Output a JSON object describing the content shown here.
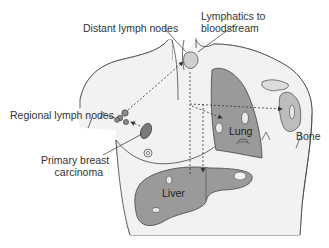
{
  "labels": {
    "distant_lymph_nodes": "Distant lymph nodes",
    "lymphatics_line1": "Lymphatics to",
    "lymphatics_line2": "bloodstream",
    "regional_lymph_nodes": "Regional lymph nodes",
    "primary_line1": "Primary breast",
    "primary_line2": "carcinoma",
    "lung": "Lung",
    "bone": "Bone",
    "liver": "Liver"
  },
  "colors": {
    "body_fill": "#f2f2f2",
    "organ_fill": "#9a9a9a",
    "outline": "#444444",
    "lesion_fill": "#e8e8e8",
    "node_fill": "#8a8a8a"
  }
}
